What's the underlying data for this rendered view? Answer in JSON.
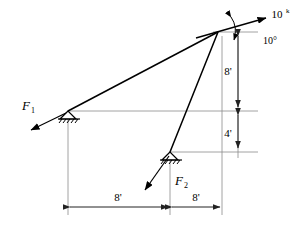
{
  "figure": {
    "stroke_color": "#000000",
    "dimension_color": "#555555",
    "background": "#ffffff"
  },
  "labels": {
    "force_1": "F",
    "force_1_sub": "1",
    "force_2": "F",
    "force_2_sub": "2",
    "applied_load": "10",
    "applied_load_unit": "k",
    "load_angle": "10°",
    "dim_vertical_upper": "8'",
    "dim_vertical_lower": "4'",
    "dim_horizontal_left": "8'",
    "dim_horizontal_right": "8'"
  },
  "geometry": {
    "apex": {
      "x": 218,
      "y": 32
    },
    "left_support": {
      "x": 68,
      "y": 111
    },
    "lower_support": {
      "x": 170,
      "y": 152
    },
    "dimension_line_x": 238,
    "dimension_line_y": 207
  },
  "supports": [
    {
      "name": "left-pin-support",
      "x": 68,
      "y": 111,
      "type": "pin-hatched"
    },
    {
      "name": "lower-pin-support",
      "x": 170,
      "y": 152,
      "type": "pin-hatched"
    }
  ],
  "forces": [
    {
      "name": "force-f1",
      "label": "F1",
      "origin_x": 68,
      "origin_y": 111,
      "tip_x": 28,
      "tip_y": 131
    },
    {
      "name": "force-f2",
      "label": "F2",
      "origin_x": 170,
      "origin_y": 152,
      "tip_x": 142,
      "tip_y": 193
    },
    {
      "name": "applied-load-10k",
      "label": "10k",
      "angle_deg": 10,
      "tip_x": 268,
      "tip_y": 17
    }
  ],
  "chart_data": {
    "type": "diagram",
    "members": [
      {
        "from": "left_support",
        "to": "apex"
      },
      {
        "from": "lower_support",
        "to": "apex"
      }
    ],
    "dimensions": [
      {
        "label": "8'",
        "orientation": "vertical",
        "from_y": 32,
        "to_y": 111
      },
      {
        "label": "4'",
        "orientation": "vertical",
        "from_y": 111,
        "to_y": 152
      },
      {
        "label": "8'",
        "orientation": "horizontal",
        "from_x": 68,
        "to_x": 170
      },
      {
        "label": "8'",
        "orientation": "horizontal",
        "from_x": 170,
        "to_x": 222
      }
    ],
    "loads": [
      {
        "label": "10k",
        "angle_deg": 10,
        "applied_at": "apex"
      },
      {
        "label": "F1",
        "applied_at": "left_support"
      },
      {
        "label": "F2",
        "applied_at": "lower_support"
      }
    ]
  }
}
